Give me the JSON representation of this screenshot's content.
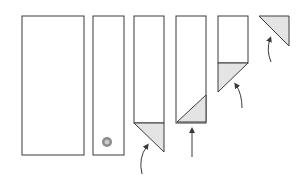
{
  "diagram": {
    "title": "",
    "colors": {
      "stroke": "#3a3a3a",
      "paper": "#ffffff",
      "shade": "#d9d9d9",
      "marker": "#6a6a6a"
    },
    "steps": [
      {
        "id": 1,
        "label": "",
        "shape": "wide-rectangle"
      },
      {
        "id": 2,
        "label": "",
        "shape": "narrow-strip-with-marker"
      },
      {
        "id": 3,
        "label": "",
        "shape": "strip-with-bottom-corner-folded-down",
        "arrow": "curved-up"
      },
      {
        "id": 4,
        "label": "",
        "shape": "strip-with-diagonal-fold",
        "arrow": "straight-up"
      },
      {
        "id": 5,
        "label": "",
        "shape": "short-strip-with-triangle-fold",
        "arrow": "curved-up"
      },
      {
        "id": 6,
        "label": "",
        "shape": "final-triangle",
        "arrow": "curved-up"
      }
    ]
  }
}
